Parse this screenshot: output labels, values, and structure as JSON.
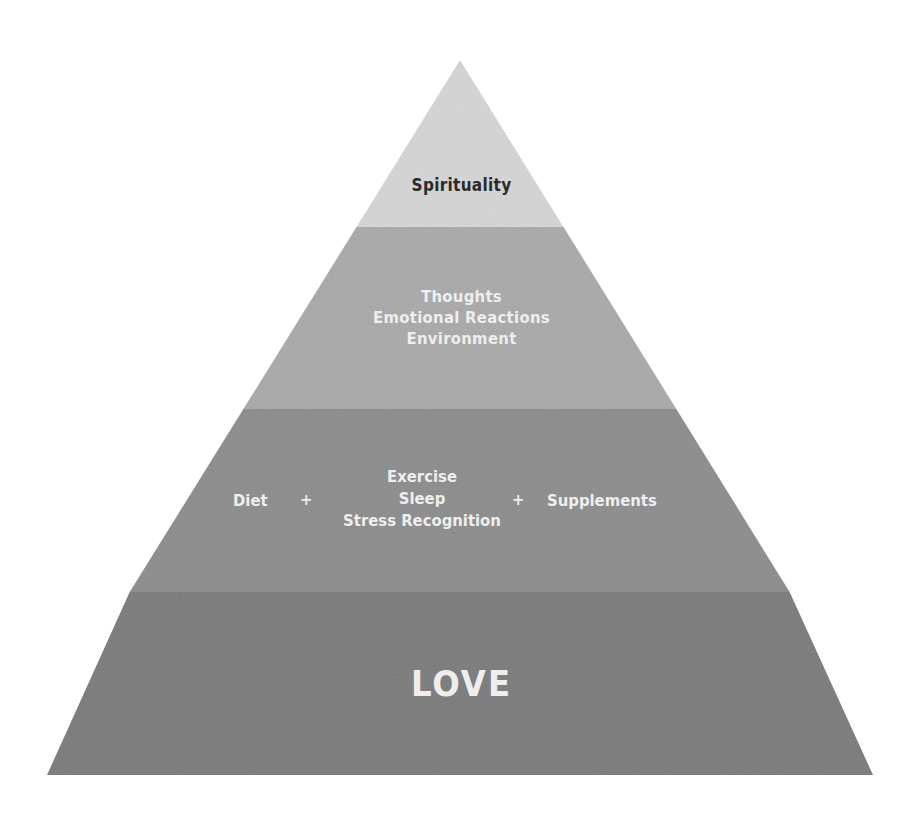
{
  "diagram": {
    "type": "pyramid",
    "colors": {
      "background": "#ffffff",
      "tier_top": "#d4d4d4",
      "tier_2": "#a9a9a9",
      "tier_3": "#8c8c8c",
      "tier_base": "#7a7a7a",
      "text_dark": "#2a2a2a",
      "text_light": "#eeeeee"
    },
    "tiers": [
      {
        "id": "top",
        "lines": [
          "Spirituality"
        ]
      },
      {
        "id": "middle-upper",
        "lines": [
          "Thoughts",
          "Emotional Reactions",
          "Environment"
        ]
      },
      {
        "id": "middle-lower",
        "left": "Diet",
        "left_operator": "+",
        "center_lines": [
          "Exercise",
          "Sleep",
          "Stress Recognition"
        ],
        "right_operator": "+",
        "right": "Supplements"
      },
      {
        "id": "base",
        "lines": [
          "LOVE"
        ]
      }
    ]
  }
}
